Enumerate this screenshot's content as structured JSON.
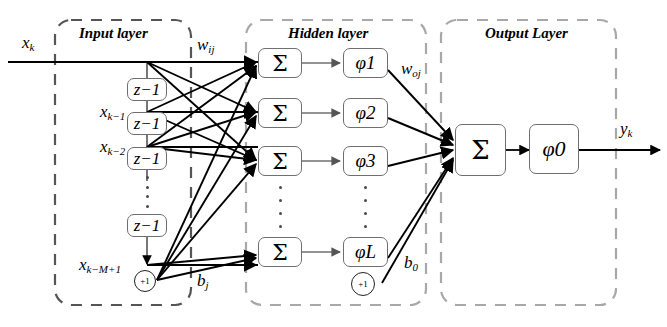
{
  "figure": {
    "type": "neural-network-diagram",
    "title_visible": false,
    "background_color": "#ffffff",
    "line_color": "#000000",
    "box_border_color": "#6f6f6f",
    "group_border_color": "#9a9a9a"
  },
  "groups": {
    "input": {
      "label": "Input layer"
    },
    "hidden": {
      "label": "Hidden layer"
    },
    "output": {
      "label": "Output Layer"
    }
  },
  "signals": {
    "input": {
      "name": "x",
      "sub": "k"
    },
    "tap1": {
      "name": "x",
      "sub": "k−1"
    },
    "tap2": {
      "name": "x",
      "sub": "k−2"
    },
    "tapM": {
      "name": "x",
      "sub": "k−M+1"
    },
    "output": {
      "name": "y",
      "sub": "k"
    }
  },
  "weights": {
    "input_to_hidden": {
      "name": "w",
      "sub": "ij"
    },
    "hidden_to_output": {
      "name": "w",
      "sub": "oj"
    },
    "hidden_bias": {
      "name": "b",
      "sub": "j"
    },
    "output_bias": {
      "name": "b",
      "sub": "0"
    }
  },
  "delays": [
    {
      "name": "z",
      "sup": "−1"
    },
    {
      "name": "z",
      "sup": "−1"
    },
    {
      "name": "z",
      "sup": "−1"
    },
    {
      "name": "z",
      "sup": "−1"
    }
  ],
  "hidden_nodes": [
    {
      "sum": "Σ",
      "act": "φ",
      "index": "1"
    },
    {
      "sum": "Σ",
      "act": "φ",
      "index": "2"
    },
    {
      "sum": "Σ",
      "act": "φ",
      "index": "3"
    },
    {
      "sum": "Σ",
      "act": "φ",
      "index": "L"
    }
  ],
  "output_node": {
    "sum": "Σ",
    "act": "φ",
    "index": "0"
  },
  "bias_units": [
    {
      "label": "+1",
      "belongs_to": "input-layer"
    },
    {
      "label": "+1",
      "belongs_to": "hidden-layer"
    }
  ]
}
